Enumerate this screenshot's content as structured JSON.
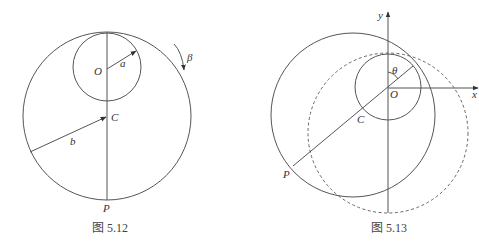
{
  "figures": [
    {
      "id": "fig-5-12",
      "caption": "图 5.12",
      "labels": {
        "O": "O",
        "a": "a",
        "C": "C",
        "b": "b",
        "P": "P",
        "beta": "β"
      },
      "elements": {
        "large_circle": "radius b, center C",
        "small_circle": "radius a, center O, internally tangent at top",
        "vertical_line": "through O and C to P",
        "rotation_arrow": "β clockwise"
      }
    },
    {
      "id": "fig-5-13",
      "caption": "图 5.13",
      "labels": {
        "x": "x",
        "y": "y",
        "O": "O",
        "C": "C",
        "P": "P",
        "theta": "θ"
      },
      "elements": {
        "axes": "x and y axes with arrowheads at origin O",
        "small_circle": "centered at O",
        "solid_circle": "center C, tangent to small circle",
        "dashed_circle": "initial position of large circle",
        "line": "from P through C and O to tangent point, angle θ from y-axis"
      }
    }
  ]
}
